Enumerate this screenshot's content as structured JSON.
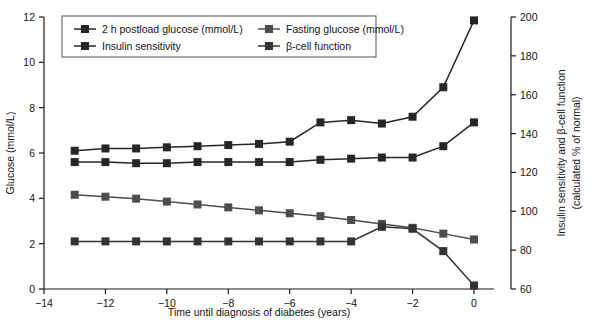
{
  "chart_data": {
    "type": "line",
    "title": "",
    "xlabel": "Time until diagnosis of diabetes (years)",
    "ylabel": "Glucose (mmol/L)",
    "ylabel_right_line1": "Insulin sensitivity and β-cell function",
    "ylabel_right_line2": "(calculated % of normal)",
    "x": [
      -13,
      -12,
      -11,
      -10,
      -9,
      -8,
      -7,
      -6,
      -5,
      -4,
      -3,
      -2,
      -1,
      0
    ],
    "xlim": [
      -14,
      0
    ],
    "xticks": [
      -14,
      -12,
      -10,
      -8,
      -6,
      -4,
      -2,
      0
    ],
    "xticklabels": [
      "−14",
      "−12",
      "−10",
      "−8",
      "−6",
      "−4",
      "−2",
      "0"
    ],
    "ylim": [
      0,
      12
    ],
    "yticks": [
      0,
      2,
      4,
      6,
      8,
      10,
      12
    ],
    "yticklabels": [
      "0",
      "2",
      "4",
      "6",
      "8",
      "10",
      "12"
    ],
    "ylim_right": [
      60,
      200
    ],
    "yticks_right": [
      60,
      80,
      100,
      120,
      140,
      160,
      180,
      200
    ],
    "yticklabels_right": [
      "60",
      "80",
      "100",
      "120",
      "140",
      "160",
      "180",
      "200"
    ],
    "grid": false,
    "legend_position": "top-left",
    "marker": "square",
    "series": [
      {
        "name": "2 h postload glucose (mmol/L)",
        "axis": "left",
        "color": "#262626",
        "values": [
          6.1,
          6.2,
          6.2,
          6.25,
          6.3,
          6.35,
          6.4,
          6.5,
          7.35,
          7.45,
          7.3,
          7.6,
          8.9,
          11.85
        ]
      },
      {
        "name": "Fasting glucose (mmol/L)",
        "axis": "left",
        "color": "#262626",
        "values": [
          5.6,
          5.6,
          5.55,
          5.55,
          5.6,
          5.6,
          5.6,
          5.6,
          5.7,
          5.75,
          5.8,
          5.8,
          6.3,
          7.35
        ]
      },
      {
        "name": "Insulin sensitivity",
        "axis": "right",
        "color": "#4d4d4d",
        "values": [
          108.5,
          107.5,
          106.5,
          105.0,
          103.5,
          102.0,
          100.5,
          99.0,
          97.5,
          95.5,
          93.5,
          91.5,
          88.5,
          85.5
        ]
      },
      {
        "name": "β-cell function",
        "axis": "right",
        "color": "#333333",
        "values": [
          84.5,
          84.5,
          84.5,
          84.5,
          84.5,
          84.5,
          84.5,
          84.5,
          84.5,
          84.5,
          92.0,
          91.0,
          79.5,
          61.8
        ]
      }
    ]
  },
  "legend": {
    "entries": [
      "2 h postload glucose (mmol/L)",
      "Insulin sensitivity",
      "Fasting glucose (mmol/L)",
      "β-cell function"
    ]
  }
}
